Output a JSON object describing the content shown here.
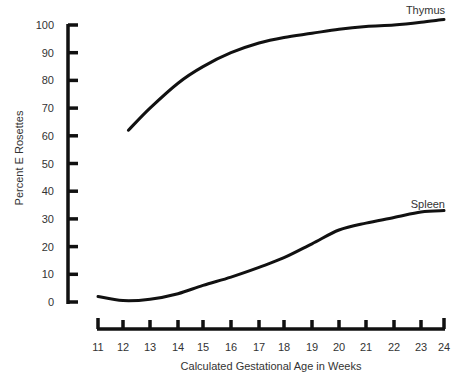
{
  "chart_data": {
    "type": "line",
    "title": "",
    "xlabel": "Calculated Gestational Age in Weeks",
    "ylabel": "Percent E Rosettes",
    "xlim": [
      11,
      24
    ],
    "ylim": [
      0,
      100
    ],
    "x_ticks": [
      11,
      12,
      13,
      14,
      15,
      16,
      17,
      18,
      19,
      20,
      21,
      22,
      23,
      24
    ],
    "y_ticks": [
      0,
      10,
      20,
      30,
      40,
      50,
      60,
      70,
      80,
      90,
      100
    ],
    "grid": false,
    "legend": "inline labels at line ends",
    "series": [
      {
        "name": "Thymus",
        "x": [
          12.2,
          13,
          14,
          15,
          16,
          17,
          18,
          19,
          20,
          21,
          22,
          23,
          24
        ],
        "values": [
          62,
          70,
          79,
          85,
          90,
          93.5,
          95.5,
          97,
          98.5,
          99.5,
          100,
          101,
          102
        ]
      },
      {
        "name": "Spleen",
        "x": [
          11,
          12,
          13,
          14,
          15,
          16,
          17,
          18,
          19,
          20,
          21,
          22,
          23,
          24
        ],
        "values": [
          2,
          0.5,
          1,
          3,
          6,
          9,
          12.5,
          16,
          21,
          26,
          28.5,
          30.5,
          32.5,
          33
        ]
      }
    ]
  },
  "labels": {
    "ylabel": "Percent E Rosettes",
    "xlabel": "Calculated Gestational Age in Weeks",
    "thymus": "Thymus",
    "spleen": "Spleen"
  }
}
